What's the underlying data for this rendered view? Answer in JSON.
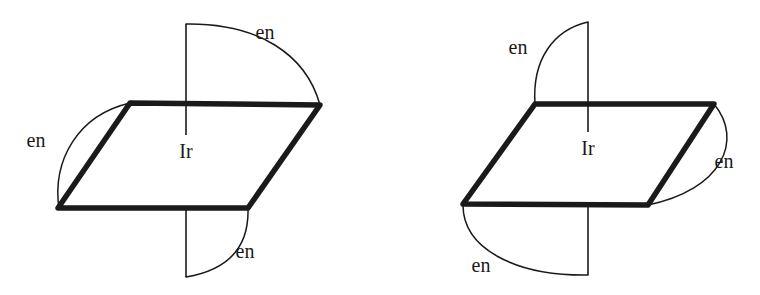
{
  "figure": {
    "background_color": "#ffffff",
    "ink_color": "#1a1a1a",
    "structures": [
      {
        "id": "left-structure",
        "name": "left-complex",
        "metal_label": "Ir",
        "ligand_labels": [
          {
            "id": "top",
            "text": "en"
          },
          {
            "id": "left",
            "text": "en"
          },
          {
            "id": "bottom",
            "text": "en"
          }
        ]
      },
      {
        "id": "right-structure",
        "name": "right-complex",
        "metal_label": "Ir",
        "ligand_labels": [
          {
            "id": "top",
            "text": "en"
          },
          {
            "id": "right",
            "text": "en"
          },
          {
            "id": "bottom",
            "text": "en"
          }
        ]
      }
    ]
  },
  "left": {
    "metal": "Ir",
    "en_top": "en",
    "en_left": "en",
    "en_bottom": "en"
  },
  "right": {
    "metal": "Ir",
    "en_top": "en",
    "en_right": "en",
    "en_bottom": "en"
  }
}
